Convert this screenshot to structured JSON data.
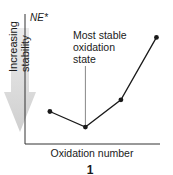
{
  "chart_data": {
    "type": "line",
    "title": "",
    "ylabel": "NE*",
    "xlabel": "Oxidation number",
    "arrow_label": [
      "Increasing",
      "stability"
    ],
    "arrow_direction": "down",
    "annotation": {
      "lines": [
        "Most stable",
        "oxidation",
        "state"
      ],
      "target_index": 1
    },
    "x": [
      1,
      2,
      3,
      4
    ],
    "y": [
      25,
      13,
      34,
      82
    ],
    "xlim": [
      0.3,
      4.1
    ],
    "ylim": [
      0,
      100
    ],
    "grid": false,
    "ticks": false,
    "colors": {
      "line": "#1a1a1a",
      "arrow": "#d9d9d9"
    }
  },
  "figure_label": "1"
}
